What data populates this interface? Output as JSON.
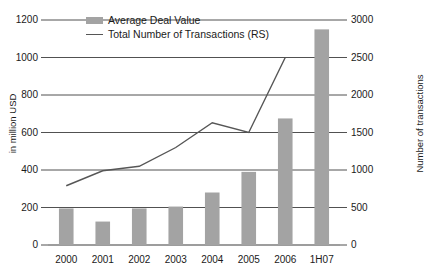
{
  "chart_data": {
    "type": "bar",
    "title": "",
    "categories": [
      "2000",
      "2001",
      "2002",
      "2003",
      "2004",
      "2005",
      "2006",
      "1H07"
    ],
    "series": [
      {
        "name": "Average Deal Value",
        "type": "bar",
        "axis": "left",
        "values": [
          195,
          125,
          195,
          205,
          280,
          390,
          675,
          1150
        ],
        "color": "#a3a3a3"
      },
      {
        "name": "Total Number of Transactions (RS)",
        "type": "line",
        "axis": "right",
        "values": [
          790,
          990,
          1050,
          1300,
          1630,
          1500,
          2500,
          null
        ],
        "color": "#565656"
      }
    ],
    "xlabel": "",
    "ylabel": "in million USD",
    "ylabel_right": "Number of transactions",
    "ylim": [
      0,
      1200
    ],
    "yticks": [
      0,
      200,
      400,
      600,
      800,
      1000,
      1200
    ],
    "ylim_right": [
      0,
      3000
    ],
    "yticks_right": [
      0,
      500,
      1000,
      1500,
      2000,
      2500,
      3000
    ],
    "grid": true,
    "legend_position": "top-left"
  },
  "legend": {
    "bar_label": "Average Deal Value",
    "line_label": "Total Number of Transactions (RS)"
  }
}
